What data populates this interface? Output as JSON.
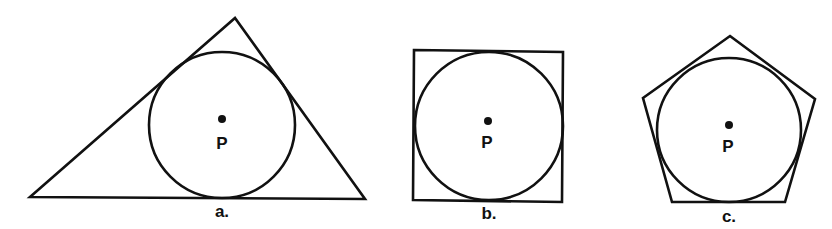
{
  "figures": [
    {
      "id": "a",
      "caption": "a.",
      "shape": "triangle",
      "center_label": "P"
    },
    {
      "id": "b",
      "caption": "b.",
      "shape": "square",
      "center_label": "P"
    },
    {
      "id": "c",
      "caption": "c.",
      "shape": "pentagon",
      "center_label": "P"
    }
  ],
  "colors": {
    "stroke": "#111111",
    "background": "#ffffff"
  }
}
